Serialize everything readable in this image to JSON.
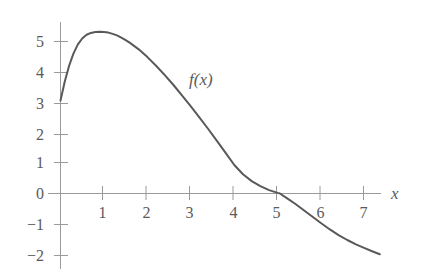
{
  "chart_data": {
    "type": "line",
    "title": "",
    "subtitle": "",
    "xlabel": "x",
    "ylabel": "",
    "curve_label": "f(x)",
    "xlim": [
      -0.27,
      7.62
    ],
    "ylim": [
      -2.42,
      5.52
    ],
    "xticks": [
      1,
      2,
      3,
      4,
      5,
      6,
      7
    ],
    "xtick_labels": [
      "1",
      "2",
      "3",
      "4",
      "5",
      "6",
      "7"
    ],
    "yticks": [
      5,
      4,
      3,
      2,
      1,
      0,
      -1,
      -2
    ],
    "ytick_labels": [
      "5",
      "4",
      "3",
      "2",
      "1",
      "0",
      "−1",
      "−2"
    ],
    "grid": false,
    "legend": "none",
    "annotations": [
      {
        "text": "f(x)",
        "x": 3.0,
        "y": 3.55
      }
    ],
    "series": [
      {
        "name": "f(x)",
        "color": "#595959",
        "x": [
          0.0,
          0.1,
          0.2,
          0.3,
          0.4,
          0.5,
          0.6,
          0.7,
          0.8,
          0.9,
          1.0,
          1.1,
          1.2,
          1.3,
          1.4,
          1.5,
          1.6,
          1.8,
          2.0,
          2.2,
          2.4,
          2.6,
          2.8,
          3.0,
          3.2,
          3.4,
          3.6,
          3.8,
          4.0,
          4.2,
          4.4,
          4.6,
          4.8,
          5.0,
          5.05,
          5.2,
          5.4,
          5.6,
          5.8,
          6.0,
          6.2,
          6.4,
          6.6,
          6.8,
          7.0,
          7.2,
          7.35
        ],
        "y": [
          3.0,
          3.62,
          4.13,
          4.52,
          4.81,
          5.0,
          5.12,
          5.18,
          5.21,
          5.22,
          5.21,
          5.19,
          5.15,
          5.1,
          5.03,
          4.95,
          4.86,
          4.65,
          4.4,
          4.12,
          3.82,
          3.5,
          3.16,
          2.81,
          2.45,
          2.08,
          1.7,
          1.31,
          0.92,
          0.62,
          0.4,
          0.24,
          0.11,
          0.02,
          0.0,
          -0.14,
          -0.33,
          -0.54,
          -0.75,
          -0.96,
          -1.16,
          -1.34,
          -1.5,
          -1.64,
          -1.76,
          -1.88,
          -1.96
        ]
      }
    ]
  },
  "axes": {
    "axis_color": "#9a9a9a",
    "text_color": "#5a5a5a",
    "curve_color": "#595959"
  }
}
